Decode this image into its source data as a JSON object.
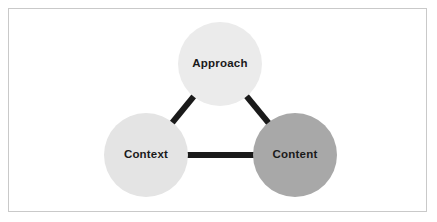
{
  "diagram": {
    "type": "triangle-venn",
    "title": "",
    "background_color": "#ffffff",
    "frame": {
      "border_color": "#c9c9c9",
      "fill_color": "#ffffff"
    },
    "connector": {
      "color": "#1a1a1a",
      "thickness": 6
    },
    "nodes": [
      {
        "id": "approach",
        "label": "Approach",
        "fill_color": "#ebebeb",
        "text_color": "#1a1a1a",
        "cx": 220,
        "cy": 64,
        "r": 42
      },
      {
        "id": "context",
        "label": "Context",
        "fill_color": "#e4e4e4",
        "text_color": "#1a1a1a",
        "cx": 146,
        "cy": 155,
        "r": 42
      },
      {
        "id": "content",
        "label": "Content",
        "fill_color": "#a8a8a8",
        "text_color": "#1a1a1a",
        "cx": 295,
        "cy": 155,
        "r": 42
      }
    ],
    "edges": [
      {
        "id": "approach-context",
        "from": "approach",
        "to": "context"
      },
      {
        "id": "approach-content",
        "from": "approach",
        "to": "content"
      },
      {
        "id": "context-content",
        "from": "context",
        "to": "content"
      }
    ]
  }
}
